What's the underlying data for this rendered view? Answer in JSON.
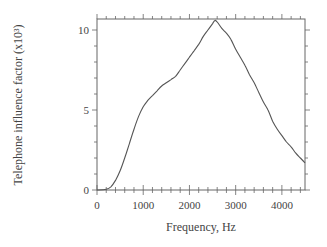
{
  "chart_data": {
    "type": "line",
    "title": "",
    "xlabel": "Frequency, Hz",
    "ylabel": "Telephone influence factor (x10³)",
    "xlim": [
      0,
      4500
    ],
    "ylim": [
      0,
      10.7
    ],
    "x_ticks": [
      0,
      1000,
      2000,
      3000,
      4000
    ],
    "x_tick_labels": [
      "0",
      "1000",
      "2000",
      "3000",
      "4000"
    ],
    "y_ticks": [
      0,
      5,
      10
    ],
    "y_tick_labels": [
      "0",
      "5",
      "10"
    ],
    "x_minor_step": 200,
    "y_minor_step": 1,
    "grid": false,
    "legend": null,
    "series": [
      {
        "name": "Telephone influence factor",
        "color": "#555555",
        "x": [
          0,
          200,
          300,
          400,
          500,
          600,
          700,
          800,
          900,
          1000,
          1100,
          1200,
          1300,
          1400,
          1500,
          1600,
          1700,
          1800,
          1900,
          2000,
          2100,
          2200,
          2300,
          2400,
          2500,
          2550,
          2600,
          2700,
          2800,
          2900,
          3000,
          3100,
          3200,
          3300,
          3400,
          3500,
          3600,
          3700,
          3800,
          3900,
          4000,
          4100,
          4200,
          4300,
          4400,
          4500
        ],
        "values": [
          0.0,
          0.05,
          0.2,
          0.6,
          1.2,
          2.0,
          2.9,
          3.8,
          4.6,
          5.2,
          5.6,
          5.9,
          6.2,
          6.5,
          6.7,
          6.9,
          7.1,
          7.5,
          7.9,
          8.3,
          8.7,
          9.1,
          9.6,
          10.0,
          10.4,
          10.6,
          10.5,
          10.1,
          9.8,
          9.4,
          8.8,
          8.3,
          7.8,
          7.2,
          6.7,
          6.1,
          5.5,
          5.0,
          4.3,
          3.8,
          3.4,
          3.0,
          2.7,
          2.3,
          2.0,
          1.7
        ]
      }
    ]
  },
  "axes": {
    "x_title": "Frequency, Hz",
    "y_title": "Telephone influence factor (x10³)"
  }
}
